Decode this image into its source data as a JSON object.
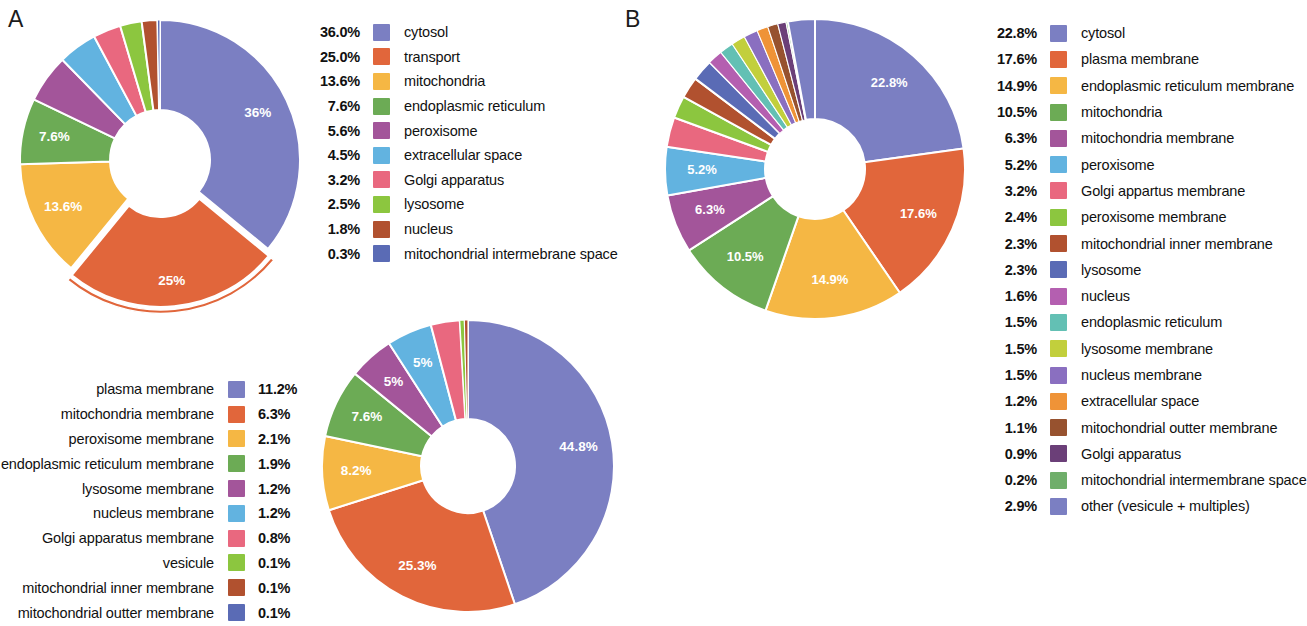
{
  "panels": {
    "a_letter": "A",
    "b_letter": "B"
  },
  "chart_data": [
    {
      "type": "pie",
      "id": "chart-a-protein-localization",
      "title": "A",
      "variant": "donut",
      "exploded_slice": "transport",
      "categories": [
        "cytosol",
        "transport",
        "mitochondria",
        "endoplasmic reticulum",
        "peroxisome",
        "extracellular space",
        "Golgi apparatus",
        "lysosome",
        "nucleus",
        "mitochondrial intermebrane space"
      ],
      "values": [
        36.0,
        25.0,
        13.6,
        7.6,
        5.6,
        4.5,
        3.2,
        2.5,
        1.8,
        0.3
      ],
      "legend_percent_labels": [
        "36.0%",
        "25.0%",
        "13.6%",
        "7.6%",
        "5.6%",
        "4.5%",
        "3.2%",
        "2.5%",
        "1.8%",
        "0.3%"
      ],
      "slice_labels": [
        "36%",
        "25%",
        "13.6%",
        "7.6%",
        "",
        "",
        "",
        "",
        "",
        ""
      ],
      "colors": [
        "#7b7fc2",
        "#e1663b",
        "#f5b744",
        "#6cab55",
        "#a3559a",
        "#62b3e0",
        "#e9687f",
        "#8cc63f",
        "#b1512f",
        "#5a6bb5"
      ],
      "legend_position": "right"
    },
    {
      "type": "pie",
      "id": "chart-c-membrane-localization",
      "variant": "donut",
      "categories": [
        "plasma membrane",
        "mitochondria membrane",
        "peroxisome membrane",
        "endoplasmic reticulum membrane",
        "lysosome membrane",
        "nucleus membrane",
        "Golgi apparatus membrane",
        "vesicule",
        "mitochondrial inner membrane",
        "mitochondrial outter membrane"
      ],
      "values": [
        11.2,
        6.3,
        2.1,
        1.9,
        1.2,
        1.2,
        0.8,
        0.1,
        0.1,
        0.1
      ],
      "legend_percent_labels": [
        "11.2%",
        "6.3%",
        "2.1%",
        "1.9%",
        "1.2%",
        "1.2%",
        "0.8%",
        "0.1%",
        "0.1%",
        "0.1%"
      ],
      "donut_values": [
        44.8,
        25.3,
        8.2,
        7.6,
        5.0,
        5.0,
        3.2,
        0.5,
        0.4
      ],
      "donut_slice_labels": [
        "44.8%",
        "25.3%",
        "8.2%",
        "7.6%",
        "5%",
        "5%",
        "",
        "",
        ""
      ],
      "donut_colors": [
        "#7b7fc2",
        "#e1663b",
        "#f5b744",
        "#6cab55",
        "#a3559a",
        "#62b3e0",
        "#e9687f",
        "#8cc63f",
        "#b1512f"
      ],
      "colors": [
        "#7b7fc2",
        "#e1663b",
        "#f5b744",
        "#6cab55",
        "#a3559a",
        "#62b3e0",
        "#e9687f",
        "#8cc63f",
        "#b1512f",
        "#5a6bb5"
      ],
      "legend_position": "left"
    },
    {
      "type": "pie",
      "id": "chart-b-localization",
      "title": "B",
      "variant": "donut",
      "categories": [
        "cytosol",
        "plasma membrane",
        "endoplasmic reticulum membrane",
        "mitochondria",
        "mitochondria membrane",
        "peroxisome",
        "Golgi appartus membrane",
        "peroxisome membrane",
        "mitochondrial inner membrane",
        "lysosome",
        "nucleus",
        "endoplasmic reticulum",
        "lysosome membrane",
        "nucleus membrane",
        "extracellular space",
        "mitochondrial outter membrane",
        "Golgi apparatus",
        "mitochondrial intermembrane space",
        "other (vesicule + multiples)"
      ],
      "values": [
        22.8,
        17.6,
        14.9,
        10.5,
        6.3,
        5.2,
        3.2,
        2.4,
        2.3,
        2.3,
        1.6,
        1.5,
        1.5,
        1.5,
        1.2,
        1.1,
        0.9,
        0.2,
        2.9
      ],
      "legend_percent_labels": [
        "22.8%",
        "17.6%",
        "14.9%",
        "10.5%",
        "6.3%",
        "5.2%",
        "3.2%",
        "2.4%",
        "2.3%",
        "2.3%",
        "1.6%",
        "1.5%",
        "1.5%",
        "1.5%",
        "1.2%",
        "1.1%",
        "0.9%",
        "0.2%",
        "2.9%"
      ],
      "slice_labels": [
        "22.8%",
        "17.6%",
        "14.9%",
        "10.5%",
        "6.3%",
        "5.2%",
        "",
        "",
        "",
        "",
        "",
        "",
        "",
        "",
        "",
        "",
        "",
        "",
        ""
      ],
      "colors": [
        "#7b7fc2",
        "#e1663b",
        "#f5b744",
        "#6cab55",
        "#a3559a",
        "#62b3e0",
        "#e9687f",
        "#8cc63f",
        "#b1512f",
        "#5a6bb5",
        "#b45fb0",
        "#63c0b4",
        "#c2cf3c",
        "#8a6fc0",
        "#ef9337",
        "#97522f",
        "#6b3f78",
        "#6fae6a",
        "#7b7fc2"
      ],
      "legend_position": "right"
    }
  ]
}
